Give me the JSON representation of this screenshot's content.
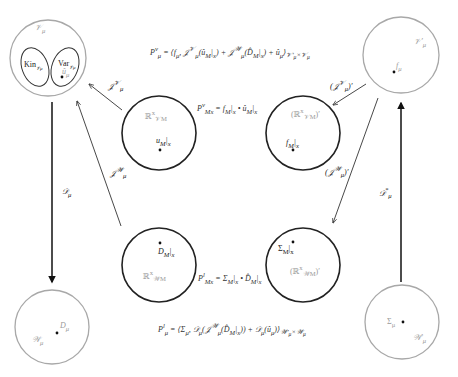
{
  "diagram": {
    "equations": {
      "top": "Pμᵛ = ⟨fμ, ℱμᵞ(û_M|ₓ) + ℱμᵠ(D̂_M|ₓ) + ûμ⟩_{𝒱μ′ × 𝒱μ}",
      "middle_top": "Pᵛ_Mₓ = f_M|ₓ • û_M|ₓ",
      "middle_bottom": "Pˡ_Mₓ = Σ_M|ₓ • D̂_M|ₓ",
      "bottom": "Pˡμ = ⟨Σμ, 𝒟μ(ℱμᵠ(D̂_M|ₓ)) + 𝒟μ(ûμ)⟩_{𝒲μ′ × 𝒲μ}"
    },
    "nodes": {
      "top_left": {
        "space": "𝒱μ",
        "sub_left": "Kin",
        "sub_left_idx": "𝒱μ",
        "sub_right": "Var",
        "sub_right_idx": "𝒱μ",
        "point": "ûμ"
      },
      "top_right": {
        "space": "𝒱μ′",
        "point": "fμ"
      },
      "mid_top_left": {
        "space": "ℝˣ",
        "space_idx": "𝒱_M",
        "point": "u_M|ₓ"
      },
      "mid_top_right": {
        "space": "(ℝˣ",
        "space_idx": "𝒱_M",
        "space_suffix": ")′",
        "point": "f_M|ₓ"
      },
      "mid_bottom_left": {
        "space": "ℝˣ",
        "space_idx": "𝒲_M",
        "point": "D̂_M|ₓ"
      },
      "mid_bottom_right": {
        "space": "(ℝˣ",
        "space_idx": "𝒲_M",
        "space_suffix": ")′",
        "point": "Σ_M|ₓ"
      },
      "bottom_left": {
        "space": "𝒲μ",
        "point": "Dμ"
      },
      "bottom_right": {
        "space": "𝒲μ′",
        "point": "Σμ"
      }
    },
    "arrows": {
      "F_v": "ℱμᵞ",
      "F_v_dual": "(ℱμᵞ)′",
      "F_w": "ℱμᵠ",
      "F_w_dual": "(ℱμᵠ)′",
      "D_mu": "𝒟μ",
      "D_mu_star": "𝒟μ*"
    }
  }
}
